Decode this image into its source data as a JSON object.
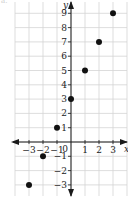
{
  "part_label": "a.",
  "chart_data": {
    "type": "scatter",
    "title": "",
    "xlabel": "x",
    "ylabel": "y",
    "xlim": [
      -3.9,
      3.9
    ],
    "ylim": [
      -3.9,
      9.9
    ],
    "grid": true,
    "x_ticks": [
      -3,
      -2,
      -1,
      1,
      2,
      3
    ],
    "y_ticks": [
      -3,
      -2,
      -1,
      1,
      2,
      3,
      4,
      5,
      6,
      7,
      8,
      9
    ],
    "origin_label": "0",
    "x": [
      -3,
      -2,
      -1,
      0,
      1,
      2,
      3
    ],
    "y": [
      -3,
      -1,
      1,
      3,
      5,
      7,
      9
    ],
    "colors": {
      "grid": "#d4d4d4",
      "axis": "#1a1a1a",
      "point": "#111111",
      "text": "#222222"
    }
  }
}
